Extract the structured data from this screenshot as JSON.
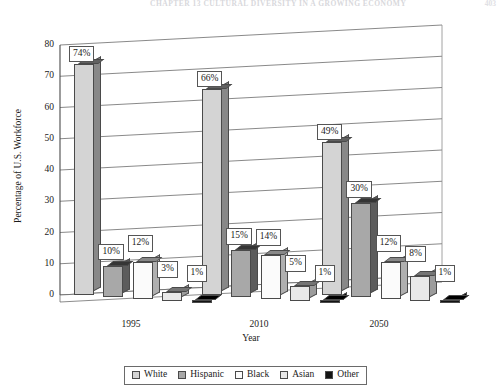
{
  "page_header": {
    "running_head": "CHAPTER 13    CULTURAL DIVERSITY IN A GROWING ECONOMY",
    "folio": "403"
  },
  "chart_data": {
    "type": "bar",
    "title": "",
    "xlabel": "Year",
    "ylabel": "Percentage of U.S. Workforce",
    "categories": [
      "1995",
      "2010",
      "2050"
    ],
    "ylim": [
      0,
      80
    ],
    "yticks": [
      0,
      10,
      20,
      30,
      40,
      50,
      60,
      70,
      80
    ],
    "ytick_labels": [
      "0",
      "10",
      "20",
      "30",
      "40",
      "50",
      "60",
      "70",
      "80"
    ],
    "grid": true,
    "legend_position": "bottom",
    "value_suffix": "%",
    "series": [
      {
        "name": "White",
        "color": "#d4d4d4",
        "values": [
          74,
          66,
          49
        ],
        "labels": [
          "74%",
          "66%",
          "49%"
        ]
      },
      {
        "name": "Hispanic",
        "color": "#a8a8a8",
        "values": [
          10,
          15,
          30
        ],
        "labels": [
          "10%",
          "15%",
          "30%"
        ]
      },
      {
        "name": "Black",
        "color": "#fbfbfb",
        "values": [
          12,
          14,
          12
        ],
        "labels": [
          "12%",
          "14%",
          "12%"
        ]
      },
      {
        "name": "Asian",
        "color": "#e8e8e8",
        "values": [
          3,
          5,
          8
        ],
        "labels": [
          "3%",
          "5%",
          "8%"
        ]
      },
      {
        "name": "Other",
        "color": "#141414",
        "values": [
          1,
          1,
          1
        ],
        "labels": [
          "1%",
          "1%",
          "1%"
        ]
      }
    ]
  }
}
